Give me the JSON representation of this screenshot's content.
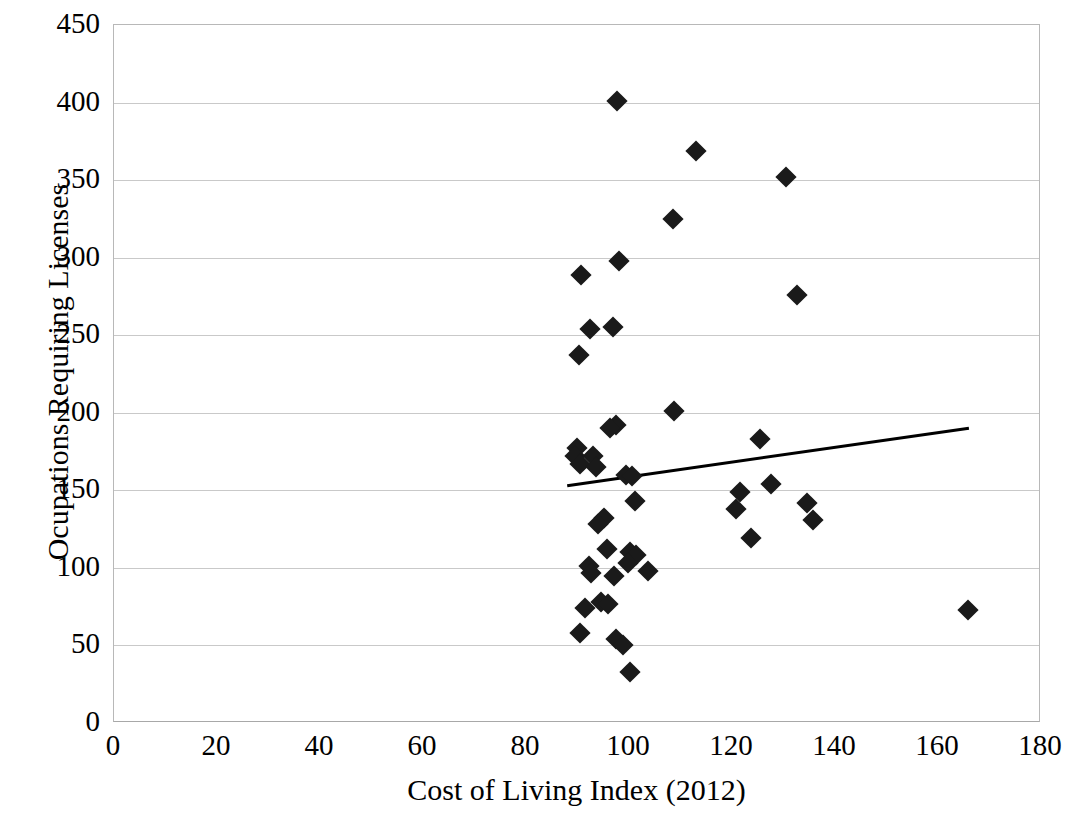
{
  "chart_data": {
    "type": "scatter",
    "title": "",
    "xlabel": "Cost of Living Index (2012)",
    "ylabel": "Ocupations Requiring Licenses",
    "xlim": [
      0,
      180
    ],
    "ylim": [
      0,
      450
    ],
    "xticks": [
      0,
      20,
      40,
      60,
      80,
      100,
      120,
      140,
      160,
      180
    ],
    "yticks": [
      0,
      50,
      100,
      150,
      200,
      250,
      300,
      350,
      400,
      450
    ],
    "grid": "horizontal",
    "legend": "none",
    "marker_style": "filled-diamond",
    "marker_color": "#1a1a1a",
    "gridline_color": "#c9c9c9",
    "axis_color": "#b8b8b8",
    "trendline": {
      "color": "#000000",
      "width": 3,
      "x": [
        88,
        166
      ],
      "y": [
        153,
        190
      ]
    },
    "series": [
      {
        "name": "States",
        "points": [
          {
            "x": 97.6,
            "y": 401
          },
          {
            "x": 113.0,
            "y": 369
          },
          {
            "x": 130.5,
            "y": 352
          },
          {
            "x": 108.5,
            "y": 325
          },
          {
            "x": 98.0,
            "y": 298
          },
          {
            "x": 90.6,
            "y": 289
          },
          {
            "x": 132.7,
            "y": 276
          },
          {
            "x": 96.9,
            "y": 255
          },
          {
            "x": 92.4,
            "y": 254
          },
          {
            "x": 90.2,
            "y": 237
          },
          {
            "x": 108.8,
            "y": 201
          },
          {
            "x": 97.5,
            "y": 192
          },
          {
            "x": 96.4,
            "y": 190
          },
          {
            "x": 125.5,
            "y": 183
          },
          {
            "x": 89.9,
            "y": 177
          },
          {
            "x": 89.6,
            "y": 172
          },
          {
            "x": 93.1,
            "y": 172
          },
          {
            "x": 90.4,
            "y": 167
          },
          {
            "x": 93.6,
            "y": 165
          },
          {
            "x": 99.4,
            "y": 160
          },
          {
            "x": 100.6,
            "y": 159
          },
          {
            "x": 127.5,
            "y": 154
          },
          {
            "x": 121.6,
            "y": 149
          },
          {
            "x": 101.1,
            "y": 143
          },
          {
            "x": 134.6,
            "y": 142
          },
          {
            "x": 120.7,
            "y": 138
          },
          {
            "x": 135.8,
            "y": 131
          },
          {
            "x": 95.1,
            "y": 132
          },
          {
            "x": 93.9,
            "y": 128
          },
          {
            "x": 123.6,
            "y": 119
          },
          {
            "x": 95.7,
            "y": 112
          },
          {
            "x": 100.1,
            "y": 110
          },
          {
            "x": 101.4,
            "y": 108
          },
          {
            "x": 99.8,
            "y": 103
          },
          {
            "x": 92.2,
            "y": 101
          },
          {
            "x": 103.6,
            "y": 98
          },
          {
            "x": 92.7,
            "y": 97
          },
          {
            "x": 97.1,
            "y": 95
          },
          {
            "x": 94.6,
            "y": 78
          },
          {
            "x": 96.0,
            "y": 77
          },
          {
            "x": 91.4,
            "y": 74
          },
          {
            "x": 165.9,
            "y": 73
          },
          {
            "x": 90.5,
            "y": 58
          },
          {
            "x": 97.5,
            "y": 54
          },
          {
            "x": 98.9,
            "y": 50
          },
          {
            "x": 100.2,
            "y": 33
          }
        ]
      }
    ]
  }
}
